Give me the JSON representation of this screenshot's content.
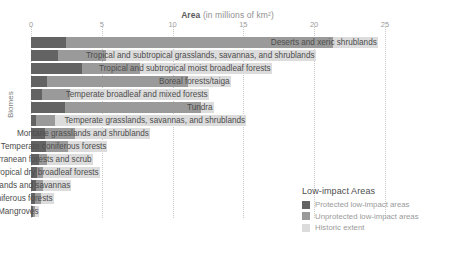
{
  "axis_title": {
    "strong": "Area",
    "sub": " (in millions of km²)"
  },
  "y_axis_label": "Biomes",
  "legend": {
    "title": "Low-impact Areas",
    "items": [
      {
        "label": "Protected low-impact areas",
        "color": "#636363",
        "key": "protected"
      },
      {
        "label": "Unprotected low-impact areas",
        "color": "#9a9a9a",
        "key": "unprotected"
      },
      {
        "label": "Historic extent",
        "color": "#dcdcdc",
        "key": "historic"
      }
    ]
  },
  "chart_data": {
    "type": "bar",
    "orientation": "horizontal",
    "stacked": true,
    "title": "Area (in millions of km²)",
    "xlabel": "Area (in millions of km²)",
    "ylabel": "Biomes",
    "xlim": [
      0,
      25.5
    ],
    "xticks": [
      0,
      5,
      10,
      15,
      20,
      25
    ],
    "xtick_labels": [
      "0",
      "5",
      "10",
      "15",
      "20",
      "25"
    ],
    "grid": "vertical-dotted",
    "legend_position": "bottom-right",
    "series": [
      {
        "name": "Protected low-impact areas",
        "color": "#636363",
        "values": [
          2.5,
          1.9,
          3.6,
          1.1,
          0.75,
          2.4,
          0.35,
          1.0,
          1.05,
          0.55,
          0.45,
          0.35,
          0.25,
          0.12
        ]
      },
      {
        "name": "Unprotected low-impact areas",
        "color": "#9a9a9a",
        "values": [
          18.8,
          3.4,
          4.1,
          10.0,
          2.0,
          9.6,
          1.35,
          2.1,
          1.55,
          0.6,
          0.4,
          0.5,
          0.45,
          0.18
        ]
      },
      {
        "name": "Historic extent",
        "color": "#dcdcdc",
        "values": [
          3.2,
          14.8,
          9.3,
          3.0,
          9.8,
          0.9,
          13.5,
          5.3,
          2.8,
          3.2,
          4.0,
          2.0,
          0.9,
          0.3
        ]
      }
    ],
    "categories": [
      "Deserts and xeric shrublands",
      "Tropical and subtropical grasslands, savannas, and shrublands",
      "Tropical and subtropical moist broadleaf forests",
      "Boreal forests/taiga",
      "Temperate broadleaf and mixed forests",
      "Tundra",
      "Temperate grasslands, savannas, and shrublands",
      "Montane grasslands and shrublands",
      "Temperate coniferous forests",
      "Mediterranean forests and scrub",
      "Tropical and subtropical dry broadleaf forests",
      "Flooded grasslands and savannas",
      "Tropical and subtropical coniferous forests",
      "Mangroves"
    ],
    "totals": [
      24.5,
      20.1,
      17.0,
      14.1,
      12.55,
      12.9,
      15.2,
      8.4,
      5.4,
      4.35,
      4.85,
      2.85,
      1.6,
      0.6
    ]
  }
}
